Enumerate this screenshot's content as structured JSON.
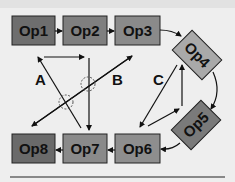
{
  "diagram": {
    "nodes": [
      {
        "id": "op1",
        "label": "Op1",
        "fill": "#6e6e6e"
      },
      {
        "id": "op2",
        "label": "Op2",
        "fill": "#7f7f7f"
      },
      {
        "id": "op3",
        "label": "Op3",
        "fill": "#8a8a8a"
      },
      {
        "id": "op4",
        "label": "Op4",
        "fill": "#a9a9a9"
      },
      {
        "id": "op5",
        "label": "Op5",
        "fill": "#7a7a7a"
      },
      {
        "id": "op6",
        "label": "Op6",
        "fill": "#8e8e8e"
      },
      {
        "id": "op7",
        "label": "Op7",
        "fill": "#8a8a8a"
      },
      {
        "id": "op8",
        "label": "Op8",
        "fill": "#6a6a6a"
      }
    ],
    "edge_labels": {
      "a": "A",
      "b": "B",
      "c": "C"
    },
    "colors": {
      "background": "#eeeeee",
      "stroke": "#111111",
      "crossing_circle": "#555555"
    }
  }
}
